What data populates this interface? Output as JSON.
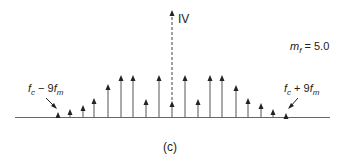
{
  "diagram": {
    "type": "frequency-spectrum",
    "caption": "(c)",
    "parameter_label": {
      "symbol": "m",
      "subscript": "f",
      "op": " = ",
      "value": "5.0"
    },
    "carrier_label": "IV",
    "left_label": {
      "f": "f",
      "fsub": "c",
      "mid": " − 9",
      "f2": "f",
      "f2sub": "m"
    },
    "right_label": {
      "f": "f",
      "fsub": "c",
      "mid": " + 9",
      "f2": "f",
      "f2sub": "m"
    },
    "baseline_y": 117,
    "carrier_x": 172,
    "carrier_top_y": 10,
    "colors": {
      "line": "#555555",
      "arrow": "#222222",
      "text": "#222222"
    },
    "spectral_lines": [
      {
        "x": 58,
        "tip_y": 112
      },
      {
        "x": 70,
        "tip_y": 109
      },
      {
        "x": 83,
        "tip_y": 105
      },
      {
        "x": 94,
        "tip_y": 98
      },
      {
        "x": 108,
        "tip_y": 84
      },
      {
        "x": 121,
        "tip_y": 75
      },
      {
        "x": 133,
        "tip_y": 75
      },
      {
        "x": 146,
        "tip_y": 99
      },
      {
        "x": 159,
        "tip_y": 75
      },
      {
        "x": 172,
        "tip_y": 101
      },
      {
        "x": 185,
        "tip_y": 75
      },
      {
        "x": 198,
        "tip_y": 99
      },
      {
        "x": 210,
        "tip_y": 75
      },
      {
        "x": 222,
        "tip_y": 75
      },
      {
        "x": 236,
        "tip_y": 85
      },
      {
        "x": 248,
        "tip_y": 98
      },
      {
        "x": 261,
        "tip_y": 103
      },
      {
        "x": 273,
        "tip_y": 109
      },
      {
        "x": 286,
        "tip_y": 113
      }
    ]
  }
}
